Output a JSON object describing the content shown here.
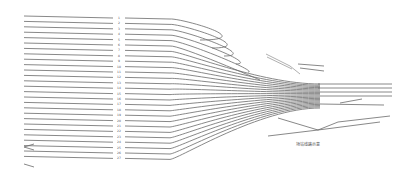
{
  "diagram": {
    "type": "railway-yard-track-layout",
    "track_labels": [
      "1",
      "2",
      "3",
      "4",
      "5",
      "6",
      "7",
      "8",
      "9",
      "10",
      "11",
      "12",
      "13",
      "14",
      "15",
      "16",
      "17",
      "18",
      "19",
      "20",
      "21",
      "22",
      "23",
      "24",
      "25",
      "26",
      "27"
    ],
    "annotation": "场站线路示意"
  }
}
